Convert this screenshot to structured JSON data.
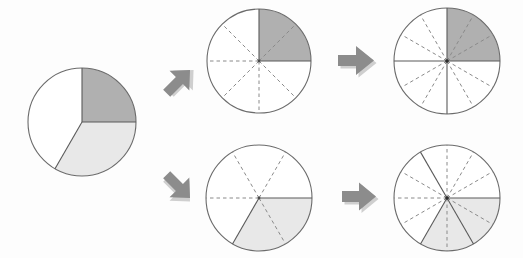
{
  "figure": {
    "background_color": "#fdfdfd",
    "colors": {
      "dark_shade": "#b0b0b0",
      "light_shade": "#e8e8e8",
      "unshaded": "#ffffff",
      "outline": "#6b6b6b",
      "divider_dashed": "#8a8a8a",
      "divider_solid": "#5a5a5a",
      "arrow_fill": "#8c8c8c",
      "arrow_shadow": "#cfcfcf"
    },
    "pies": [
      {
        "id": "source-pie",
        "label": "Original pie chart",
        "cx": 82,
        "cy": 122,
        "r": 54,
        "sectors": 0,
        "slices": [
          {
            "name": "dark-quarter",
            "start_deg": 270,
            "end_deg": 360,
            "fill": "#b0b0b0",
            "fraction_label": "1/4"
          },
          {
            "name": "light-third",
            "start_deg": 0,
            "end_deg": 120,
            "fill": "#e8e8e8",
            "fraction_label": "1/3"
          },
          {
            "name": "white-remainder",
            "start_deg": 120,
            "end_deg": 270,
            "fill": "#ffffff",
            "fraction_label": "5/12"
          }
        ],
        "solid_radii_deg": [
          270,
          0,
          120
        ]
      },
      {
        "id": "top-middle-pie",
        "label": "Pie divided into 8 equal sectors, 2 shaded dark",
        "cx": 259,
        "cy": 61,
        "r": 52,
        "sectors": 8,
        "shaded_sectors": 2,
        "shade_fill": "#b0b0b0",
        "shade_start_deg": 270,
        "shade_end_deg": 360,
        "fraction_label": "2/8",
        "solid_radii_deg": [
          270,
          0
        ]
      },
      {
        "id": "top-right-pie",
        "label": "Pie divided into 12 equal sectors, 3 shaded dark",
        "cx": 447,
        "cy": 61,
        "r": 53,
        "sectors": 12,
        "shaded_sectors": 3,
        "shade_fill": "#b0b0b0",
        "shade_start_deg": 270,
        "shade_end_deg": 360,
        "fraction_label": "3/12",
        "solid_radii_deg": [
          270,
          0,
          90,
          180
        ]
      },
      {
        "id": "bottom-middle-pie",
        "label": "Pie divided into 6 equal sectors, 2 shaded light",
        "cx": 259,
        "cy": 198,
        "r": 53,
        "sectors": 6,
        "shaded_sectors": 2,
        "shade_fill": "#e8e8e8",
        "shade_start_deg": 0,
        "shade_end_deg": 120,
        "fraction_label": "2/6",
        "solid_radii_deg": [
          0,
          120
        ]
      },
      {
        "id": "bottom-right-pie",
        "label": "Pie divided into 12 equal sectors, 4 shaded light",
        "cx": 447,
        "cy": 198,
        "r": 53,
        "sectors": 12,
        "shaded_sectors": 4,
        "shade_fill": "#e8e8e8",
        "shade_start_deg": 0,
        "shade_end_deg": 120,
        "fraction_label": "4/12",
        "solid_radii_deg": [
          0,
          120,
          60
        ]
      }
    ],
    "arrows": [
      {
        "id": "arrow-up-right",
        "direction": "up-right",
        "x": 158,
        "y": 62,
        "size": 38,
        "rotation_deg": -45
      },
      {
        "id": "arrow-down-right",
        "direction": "down-right",
        "x": 158,
        "y": 166,
        "size": 38,
        "rotation_deg": 45
      },
      {
        "id": "arrow-right-top",
        "direction": "right",
        "x": 336,
        "y": 42,
        "size": 38,
        "rotation_deg": 0
      },
      {
        "id": "arrow-right-bottom",
        "direction": "right",
        "x": 340,
        "y": 179,
        "size": 36,
        "rotation_deg": 0
      }
    ]
  }
}
